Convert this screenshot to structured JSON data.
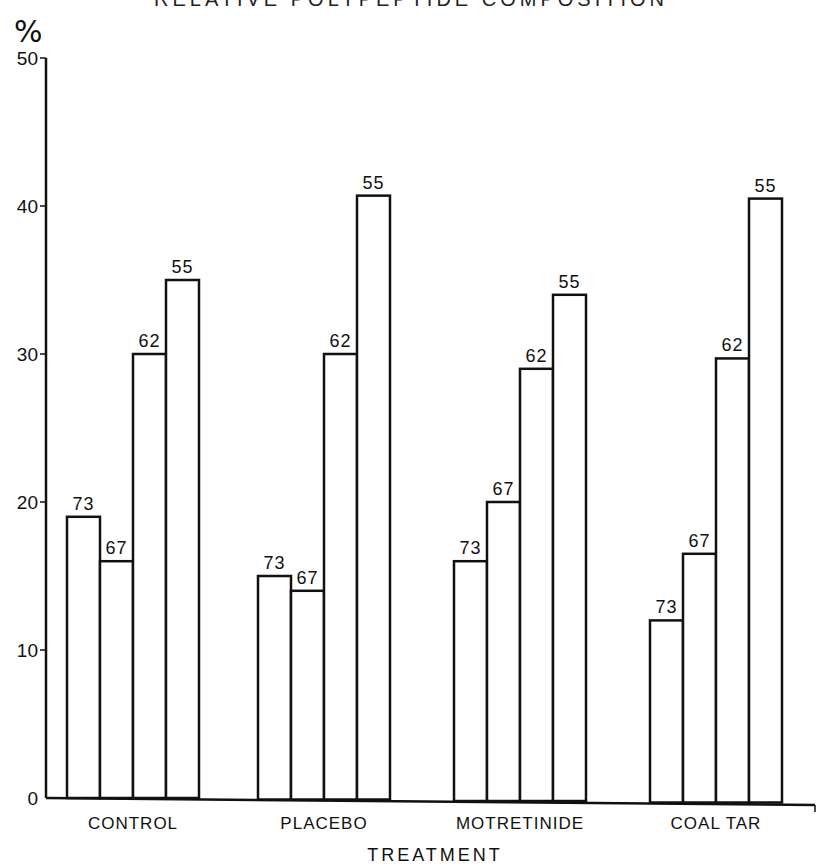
{
  "chart_data": {
    "type": "bar",
    "title": "RELATIVE POLYPEPTIDE COMPOSITION",
    "xlabel": "TREATMENT",
    "ylabel": "%",
    "ylim": [
      0,
      50
    ],
    "yticks": [
      0,
      10,
      20,
      30,
      40,
      50
    ],
    "grid": false,
    "legend": null,
    "categories": [
      "CONTROL",
      "PLACEBO",
      "MOTRETINIDE",
      "COAL TAR"
    ],
    "series": [
      {
        "name": "73",
        "values": [
          19,
          15,
          16,
          12
        ]
      },
      {
        "name": "67",
        "values": [
          16,
          14,
          20,
          16.5
        ]
      },
      {
        "name": "62",
        "values": [
          30,
          30,
          29,
          29.7
        ]
      },
      {
        "name": "55",
        "values": [
          35,
          40.7,
          34,
          40.5
        ]
      }
    ],
    "annotations": "Each bar labeled above with polypeptide size (73, 67, 62, 55)"
  },
  "labels": {
    "title": "RELATIVE POLYPEPTIDE COMPOSITION",
    "y_unit": "%",
    "x_title": "TREATMENT"
  }
}
